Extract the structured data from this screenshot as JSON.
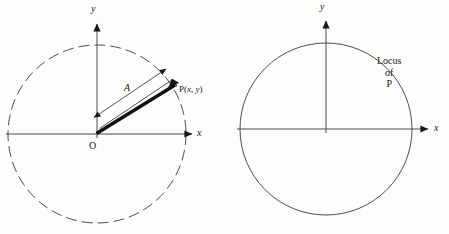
{
  "figure": {
    "width": 449,
    "height": 234,
    "background_color": "#fdfdfc",
    "ink_color": "#18181b"
  },
  "panels": [
    {
      "id": "left",
      "name": "vector-diagram",
      "axes": {
        "x_label": "x",
        "y_label": "y",
        "origin_label": "O"
      },
      "circle": {
        "style": "dashed",
        "center_x": 97,
        "center_y": 134,
        "radius": 89,
        "dash_pattern": "11 5"
      },
      "vector": {
        "label": "A",
        "tail_x": 97,
        "tail_y": 134,
        "tip_x": 172,
        "tip_y": 84,
        "style": "bold-arrow"
      },
      "point": {
        "label": "P(x, y)",
        "label_prefix": "P(",
        "label_x_var": "x",
        "label_sep": ", ",
        "label_y_var": "y",
        "label_suffix": ")",
        "x": 172,
        "y": 84
      },
      "dimension_line": {
        "label": "A",
        "from_x": 93,
        "from_y": 118,
        "to_x": 167,
        "to_y": 68,
        "arrowheads": "both"
      }
    },
    {
      "id": "right",
      "name": "locus-diagram",
      "axes": {
        "x_label": "x",
        "y_label": "y"
      },
      "circle": {
        "style": "solid",
        "center_x": 101,
        "center_y": 129,
        "radius": 86
      },
      "annotation": {
        "line1": "Locus",
        "line2": "of",
        "line3": "P",
        "x": 158,
        "y": 56
      }
    }
  ]
}
